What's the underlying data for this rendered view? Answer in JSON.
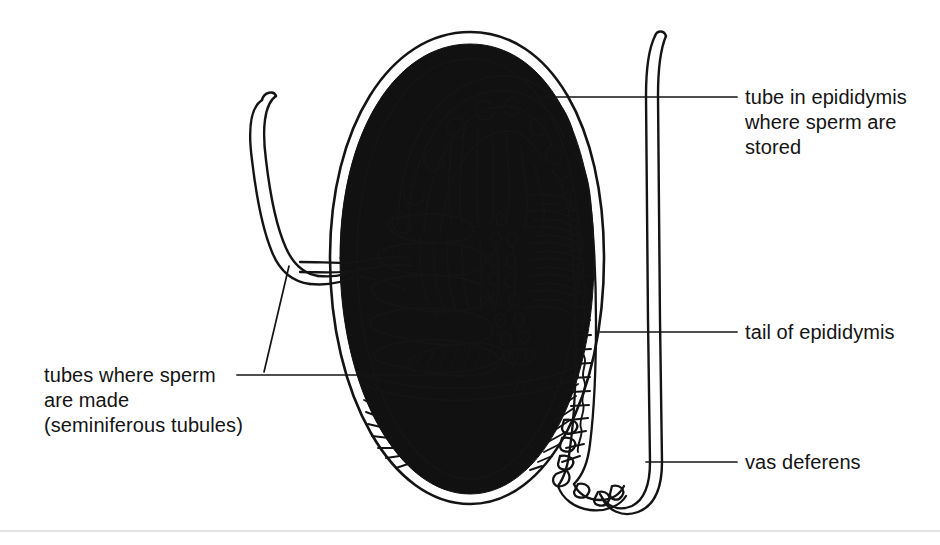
{
  "figure": {
    "type": "anatomical-line-diagram",
    "background_color": "#ffffff",
    "ink_color": "#141414",
    "fill_color": "#111111"
  },
  "labels": [
    {
      "id": "tube-in-epididymis",
      "text": "tube in epididymis\nwhere sperm are\nstored",
      "lines": [
        "tube in epididymis",
        "where sperm are",
        "stored"
      ],
      "align": "left",
      "leader": {
        "from_x": 540,
        "from_y": 97,
        "to_x": 737,
        "to_y": 97
      }
    },
    {
      "id": "tail-of-epididymis",
      "text": "tail of epididymis",
      "lines": [
        "tail of epididymis"
      ],
      "align": "left",
      "leader": {
        "from_x": 600,
        "from_y": 332,
        "to_x": 737,
        "to_y": 332
      }
    },
    {
      "id": "vas-deferens",
      "text": "vas deferens",
      "lines": [
        "vas deferens"
      ],
      "align": "left",
      "leader": {
        "from_x": 646,
        "from_y": 462,
        "to_x": 737,
        "to_y": 462
      }
    },
    {
      "id": "seminiferous-tubules",
      "text": "tubes where sperm\nare made\n(seminiferous tubules)",
      "lines": [
        "tubes where sperm",
        "are made",
        "(seminiferous tubules)"
      ],
      "align": "left",
      "leader": {
        "from_x": 237,
        "from_y": 375,
        "to_x": 462,
        "to_y": 375
      },
      "leader2": {
        "from_x": 264,
        "from_y": 372,
        "to_x": 289,
        "to_y": 266
      }
    }
  ],
  "structures": [
    {
      "id": "tunica-albuginea",
      "name": "tunica albuginea (black capsule)"
    },
    {
      "id": "tunica-vaginalis",
      "name": "tunica vaginalis (outer thin line)"
    },
    {
      "id": "head-of-epididymis",
      "name": "head of epididymis"
    },
    {
      "id": "body-of-epididymis",
      "name": "body of epididymis"
    },
    {
      "id": "tail-of-epididymis",
      "name": "tail of epididymis"
    },
    {
      "id": "efferent-ductules",
      "name": "efferent ductules"
    },
    {
      "id": "rete-testis",
      "name": "rete testis"
    },
    {
      "id": "seminiferous-tubules",
      "name": "seminiferous tubules (lobules)"
    },
    {
      "id": "vas-deferens",
      "name": "vas deferens"
    },
    {
      "id": "aberrant-ductule",
      "name": "aberrant ductule / appendix"
    },
    {
      "id": "mediastinum",
      "name": "mediastinum testis"
    }
  ]
}
